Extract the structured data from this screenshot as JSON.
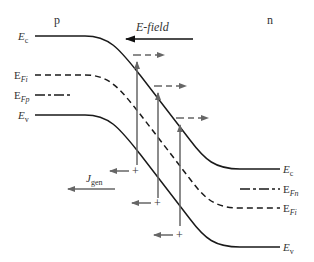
{
  "diagram": {
    "region_labels": {
      "p": "p",
      "n": "n"
    },
    "efield_label": "E-field",
    "jgen": {
      "main": "J",
      "sub": "gen"
    },
    "left_levels": [
      {
        "main": "E",
        "sub": "c"
      },
      {
        "main": "E",
        "sub": "Fi"
      },
      {
        "main": "E",
        "sub": "Fp"
      },
      {
        "main": "E",
        "sub": "v"
      }
    ],
    "right_levels": [
      {
        "main": "E",
        "sub": "c"
      },
      {
        "main": "E",
        "sub": "Fn"
      },
      {
        "main": "E",
        "sub": "Fi"
      },
      {
        "main": "E",
        "sub": "v"
      }
    ],
    "carrier_symbols": {
      "electron": "–",
      "hole": "+"
    },
    "colors": {
      "band": "#1a1a1a",
      "arrow": "#666666",
      "text": "#333333"
    }
  }
}
